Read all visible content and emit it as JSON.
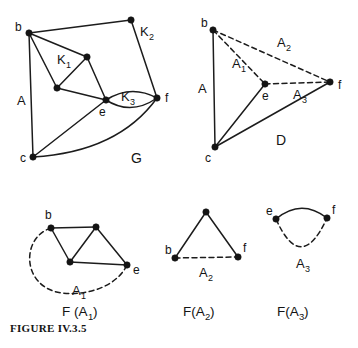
{
  "figure": {
    "caption": "FIGURE IV.3.5",
    "panels": [
      {
        "id": "panel-g",
        "name": "G",
        "label": "G",
        "label_pos": [
          131,
          163
        ],
        "vertices": [
          {
            "id": "b",
            "label": "b",
            "x": 29,
            "y": 33,
            "label_x": 15,
            "label_y": 31
          },
          {
            "id": "k2top",
            "label": "",
            "x": 131,
            "y": 20,
            "label_x": 0,
            "label_y": 0
          },
          {
            "id": "k1r",
            "label": "",
            "x": 87,
            "y": 57,
            "label_x": 0,
            "label_y": 0
          },
          {
            "id": "k1l",
            "label": "",
            "x": 57,
            "y": 88,
            "label_x": 0,
            "label_y": 0
          },
          {
            "id": "e",
            "label": "e",
            "x": 106,
            "y": 100,
            "label_x": 99,
            "label_y": 116
          },
          {
            "id": "f",
            "label": "f",
            "x": 157,
            "y": 98,
            "label_x": 165,
            "label_y": 102
          },
          {
            "id": "c",
            "label": "c",
            "x": 33,
            "y": 157,
            "label_x": 20,
            "label_y": 162
          }
        ],
        "region_labels": [
          {
            "text": "K",
            "sub": "1",
            "x": 57,
            "y": 64
          },
          {
            "text": "K",
            "sub": "2",
            "x": 140,
            "y": 36
          },
          {
            "text": "K",
            "sub": "3",
            "x": 121,
            "y": 101
          },
          {
            "text": "A",
            "sub": "",
            "x": 17,
            "y": 105
          }
        ]
      },
      {
        "id": "panel-d",
        "name": "D",
        "label": "D",
        "label_pos": [
          276,
          145
        ],
        "vertices": [
          {
            "id": "b",
            "label": "b",
            "x": 213,
            "y": 30,
            "label_x": 201,
            "label_y": 27
          },
          {
            "id": "e",
            "label": "e",
            "x": 265,
            "y": 84,
            "label_x": 262,
            "label_y": 100
          },
          {
            "id": "f",
            "label": "f",
            "x": 330,
            "y": 82,
            "label_x": 338,
            "label_y": 89
          },
          {
            "id": "c",
            "label": "c",
            "x": 215,
            "y": 147,
            "label_x": 205,
            "label_y": 162
          }
        ],
        "region_labels": [
          {
            "text": "A",
            "sub": "",
            "x": 198,
            "y": 93
          },
          {
            "text": "A",
            "sub": "1",
            "x": 232,
            "y": 68
          },
          {
            "text": "A",
            "sub": "2",
            "x": 277,
            "y": 47
          },
          {
            "text": "A",
            "sub": "3",
            "x": 293,
            "y": 99
          }
        ]
      },
      {
        "id": "panel-fa1",
        "name": "F(A1)",
        "label": "F (A",
        "label_sub": "1",
        "label_close": ")",
        "label_pos": [
          62,
          310
        ],
        "vertices": [
          {
            "id": "b",
            "label": "b",
            "x": 51,
            "y": 228,
            "label_x": 45,
            "label_y": 219
          },
          {
            "id": "top",
            "label": "",
            "x": 96,
            "y": 227,
            "label_x": 0,
            "label_y": 0
          },
          {
            "id": "mid",
            "label": "",
            "x": 70,
            "y": 262,
            "label_x": 0,
            "label_y": 0
          },
          {
            "id": "e",
            "label": "e",
            "x": 127,
            "y": 265,
            "label_x": 133,
            "label_y": 274
          }
        ],
        "region_labels": [
          {
            "text": "A",
            "sub": "1",
            "x": 72,
            "y": 295
          }
        ]
      },
      {
        "id": "panel-fa2",
        "name": "F(A2)",
        "label": "F(A",
        "label_sub": "2",
        "label_close": ")",
        "label_pos": [
          183,
          310
        ],
        "vertices": [
          {
            "id": "apex",
            "label": "",
            "x": 206,
            "y": 212,
            "label_x": 0,
            "label_y": 0
          },
          {
            "id": "b",
            "label": "b",
            "x": 175,
            "y": 258,
            "label_x": 165,
            "label_y": 254
          },
          {
            "id": "f",
            "label": "f",
            "x": 238,
            "y": 257,
            "label_x": 243,
            "label_y": 252
          }
        ],
        "region_labels": [
          {
            "text": "A",
            "sub": "2",
            "x": 199,
            "y": 277
          }
        ]
      },
      {
        "id": "panel-fa3",
        "name": "F(A3)",
        "label": "F(A",
        "label_sub": "3",
        "label_close": ")",
        "label_pos": [
          277,
          310
        ],
        "vertices": [
          {
            "id": "e",
            "label": "e",
            "x": 276,
            "y": 219,
            "label_x": 266,
            "label_y": 215
          },
          {
            "id": "f",
            "label": "f",
            "x": 327,
            "y": 218,
            "label_x": 332,
            "label_y": 214
          }
        ],
        "region_labels": [
          {
            "text": "A",
            "sub": "3",
            "x": 296,
            "y": 268
          }
        ]
      }
    ]
  },
  "style": {
    "ink": "#1c1c1c",
    "background": "#ffffff"
  }
}
